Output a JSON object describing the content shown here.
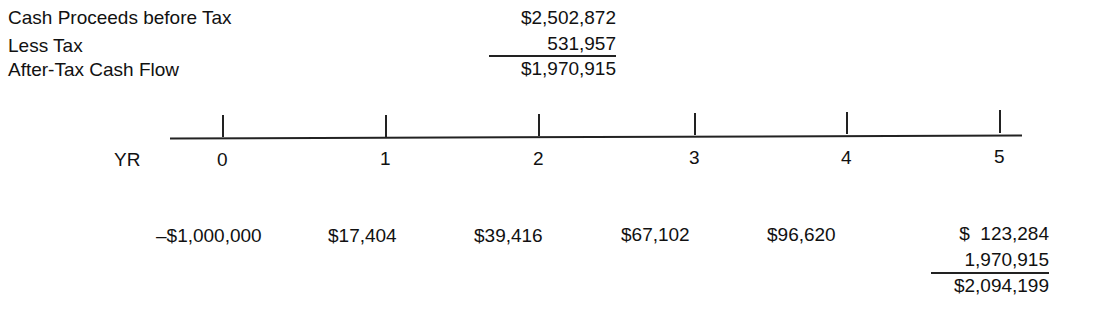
{
  "summary": {
    "rows": [
      {
        "label": "Cash Proceeds before Tax",
        "value": "$2,502,872"
      },
      {
        "label": "Less Tax",
        "value": "531,957"
      },
      {
        "label": "After-Tax Cash Flow",
        "value": "$1,970,915"
      }
    ]
  },
  "timeline": {
    "axis_label": "YR",
    "years": [
      "0",
      "1",
      "2",
      "3",
      "4",
      "5"
    ],
    "cash_flows": [
      "–$1,000,000",
      "$17,404",
      "$39,416",
      "$67,102",
      "$96,620",
      "$  123,284"
    ],
    "year5_addition": "1,970,915",
    "year5_total": "$2,094,199"
  }
}
